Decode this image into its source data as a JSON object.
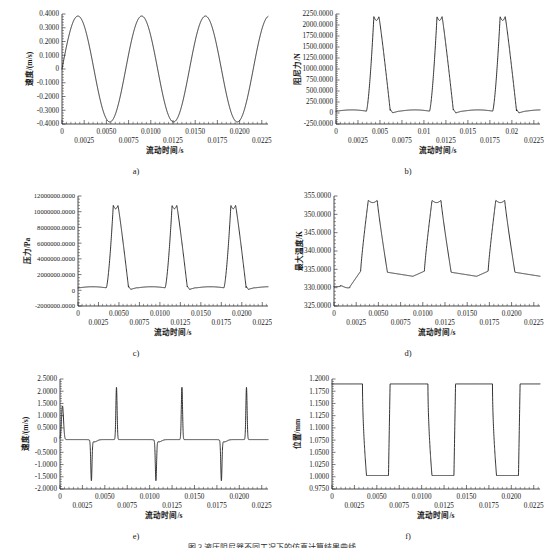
{
  "figure": {
    "caption": "图 3  液压阻尼器不同工况下的仿真计算结果曲线",
    "panel_labels": [
      "a)",
      "b)",
      "c)",
      "d)",
      "e)",
      "f)"
    ],
    "shared_xlabel": "流动时间/s"
  },
  "chart_data": [
    {
      "id": "a",
      "type": "line",
      "title": "",
      "panel_label": "a)",
      "xlabel": "流动时间/s",
      "ylabel": "速度/(m/s)",
      "xlim": [
        0,
        0.0232
      ],
      "ylim": [
        -0.4,
        0.4
      ],
      "grid": false,
      "legend": "none",
      "xticks_top": [
        "0",
        "0.0050",
        "0.0100",
        "0.0150",
        "0.0200"
      ],
      "xticks_bottom": [
        "0.0025",
        "0.0075",
        "0.0125",
        "0.0175",
        "0.0225"
      ],
      "yticks": [
        "0.4000",
        "0.3000",
        "0.2000",
        "0.1000",
        "0",
        "-0.1000",
        "-0.2000",
        "-0.3000",
        "-0.4000"
      ],
      "waveform": "sine",
      "amplitude": 0.385,
      "period": 0.00718,
      "phase_offset": 0.0,
      "baseline": 0.0,
      "peak_value": 0.385,
      "trough_value": -0.385,
      "series_name": "速度"
    },
    {
      "id": "b",
      "type": "line",
      "title": "",
      "panel_label": "b)",
      "xlabel": "流动时间/s",
      "ylabel": "阻尼力/N",
      "xlim": [
        0,
        0.0232
      ],
      "ylim": [
        -250,
        2250
      ],
      "grid": false,
      "legend": "none",
      "xticks_top": [
        "0",
        "0.005",
        "0.01",
        "0.015",
        "0.02"
      ],
      "xticks_bottom": [
        "0.0025",
        "0.0075",
        "0.0125",
        "0.0175",
        "0.0225"
      ],
      "yticks": [
        "2250.0000",
        "2000.0000",
        "1750.0000",
        "1500.0000",
        "1250.0000",
        "1000.0000",
        "750.0000",
        "500.0000",
        "250.0000",
        "0",
        "-250.0000"
      ],
      "waveform": "sharp-pulse",
      "baseline": 40,
      "peak_value": 2190,
      "period": 0.00718,
      "peak_times": [
        0.004,
        0.0112,
        0.0185
      ],
      "series_name": "阻尼力"
    },
    {
      "id": "c",
      "type": "line",
      "title": "",
      "panel_label": "c)",
      "xlabel": "流动时间/s",
      "ylabel": "压力/Pa",
      "xlim": [
        0,
        0.0232
      ],
      "ylim": [
        -2000000,
        12000000
      ],
      "grid": false,
      "legend": "none",
      "xticks_top": [
        "0",
        "0.0050",
        "0.0100",
        "0.0150",
        "0.0200"
      ],
      "xticks_bottom": [
        "0.0025",
        "0.0075",
        "0.0125",
        "0.0175",
        "0.0225"
      ],
      "yticks": [
        "12000000.0000",
        "10000000.0000",
        "8000000.0000",
        "6000000.0000",
        "4000000.0000",
        "2000000.0000",
        "0",
        "-2000000.0000"
      ],
      "waveform": "sharp-pulse",
      "baseline": 300000,
      "peak_value": 10800000,
      "period": 0.00718,
      "peak_times": [
        0.0042,
        0.0114,
        0.0186
      ],
      "series_name": "压力"
    },
    {
      "id": "d",
      "type": "line",
      "title": "",
      "panel_label": "d)",
      "xlabel": "流动时间/s",
      "ylabel": "最大温度/K",
      "xlim": [
        0,
        0.0232
      ],
      "ylim": [
        325,
        355
      ],
      "grid": false,
      "legend": "none",
      "xticks_top": [
        "0",
        "0.0050",
        "0.0100",
        "0.0150",
        "0.0200"
      ],
      "xticks_bottom": [
        "0.0025",
        "0.0075",
        "0.0125",
        "0.0175",
        "0.0225"
      ],
      "yticks": [
        "355.0000",
        "350.0000",
        "345.0000",
        "340.0000",
        "335.0000",
        "330.0000",
        "325.0000"
      ],
      "waveform": "plateau-pulse",
      "baseline": 333.6,
      "initial_value": 330.3,
      "peak_value": 353.8,
      "period": 0.00718,
      "peak_times": [
        0.0044,
        0.0116,
        0.0188
      ],
      "series_name": "最大温度"
    },
    {
      "id": "e",
      "type": "line",
      "title": "",
      "panel_label": "e)",
      "xlabel": "流动时间/s",
      "ylabel": "速度/(m/s)",
      "xlim": [
        0,
        0.0232
      ],
      "ylim": [
        -2.0,
        2.5
      ],
      "grid": false,
      "legend": "none",
      "xticks_top": [
        "0",
        "0.0050",
        "0.0100",
        "0.0150",
        "0.0200"
      ],
      "xticks_bottom": [
        "0.0025",
        "0.0075",
        "0.0125",
        "0.0175",
        "0.0225"
      ],
      "yticks": [
        "2.5000",
        "2.0000",
        "1.5000",
        "1.0000",
        "0.5000",
        "0",
        "-0.5000",
        "-1.0000",
        "-1.5000",
        "-2.0000"
      ],
      "waveform": "spikes",
      "baseline": 0.02,
      "initial_spike": 1.38,
      "negative_spikes": {
        "times": [
          0.0035,
          0.0107,
          0.018
        ],
        "value": -1.62
      },
      "positive_spikes": {
        "times": [
          0.0063,
          0.0136,
          0.0208
        ],
        "value": 2.16
      },
      "series_name": "速度"
    },
    {
      "id": "f",
      "type": "line",
      "title": "",
      "panel_label": "f)",
      "xlabel": "流动时间/s",
      "ylabel": "位置/mm",
      "xlim": [
        0,
        0.0232
      ],
      "ylim": [
        0.975,
        1.2
      ],
      "grid": false,
      "legend": "none",
      "xticks_top": [
        "0",
        "0.0050",
        "0.0100",
        "0.0150",
        "0.0200"
      ],
      "xticks_bottom": [
        "0.0025",
        "0.0075",
        "0.0125",
        "0.0175",
        "0.0225"
      ],
      "yticks": [
        "1.2000",
        "1.1750",
        "1.1500",
        "1.1250",
        "1.1000",
        "1.0750",
        "1.0500",
        "1.0250",
        "1.0000",
        "0.9750"
      ],
      "waveform": "square",
      "high_value": 1.19,
      "low_value": 1.0025,
      "period": 0.00718,
      "fall_times": [
        0.0034,
        0.0107,
        0.0179
      ],
      "rise_times": [
        0.0063,
        0.0136,
        0.0208
      ],
      "series_name": "位置"
    }
  ],
  "colors": {
    "curve": "#1d1d1d",
    "axis": "#1d1d1d",
    "background": "#ffffff",
    "text": "#1a1a1a"
  }
}
